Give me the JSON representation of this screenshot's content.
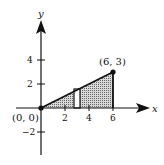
{
  "figure": {
    "axes": {
      "x_label": "x",
      "y_label": "y",
      "x_ticks": [
        "2",
        "4",
        "6"
      ],
      "y_ticks": [
        "4",
        "2",
        "−2"
      ]
    },
    "points": [
      {
        "label": "(0, 0)",
        "x": 0,
        "y": 0
      },
      {
        "label": "(6, 3)",
        "x": 6,
        "y": 3
      }
    ],
    "line": "y = x/2 from (0,0) to (6,3)",
    "shaded_region": "triangle under line from x=0 to x=6",
    "representative_rectangle": {
      "x_center": 3,
      "width": 0.5
    }
  }
}
